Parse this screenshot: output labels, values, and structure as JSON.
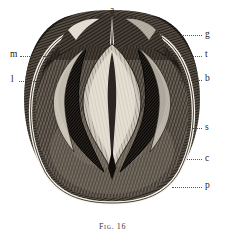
{
  "figure": {
    "caption_prefix": "Fig.",
    "caption_number": "16",
    "caption_full": "Fig. 16",
    "technique": "wood-engraving-line-hatching",
    "background_color": "#ffffff",
    "ink_color": "#1a1a1a"
  },
  "labels": {
    "a": "a",
    "g": "g",
    "t": "t",
    "b": "b",
    "s": "s",
    "c": "c",
    "p": "p",
    "m": "m",
    "l": "l"
  },
  "callouts": [
    {
      "key": "a",
      "text": "a",
      "side": "top"
    },
    {
      "key": "g",
      "text": "g",
      "side": "right"
    },
    {
      "key": "t",
      "text": "t",
      "side": "right"
    },
    {
      "key": "b",
      "text": "b",
      "side": "right"
    },
    {
      "key": "s",
      "text": "s",
      "side": "right"
    },
    {
      "key": "c",
      "text": "c",
      "side": "right"
    },
    {
      "key": "p",
      "text": "p",
      "side": "right"
    },
    {
      "key": "m",
      "text": "m",
      "side": "left"
    },
    {
      "key": "l",
      "text": "l",
      "side": "left"
    }
  ]
}
